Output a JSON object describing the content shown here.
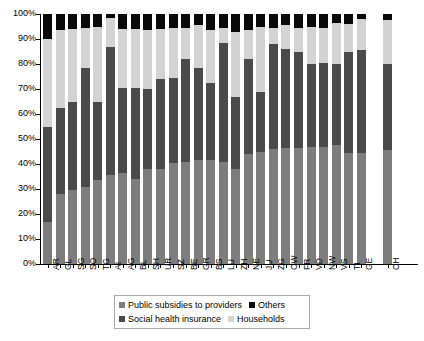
{
  "chart_data": {
    "type": "bar",
    "subtype": "stacked-percentage",
    "title": "",
    "subtitle": "",
    "xlabel": "",
    "ylabel": "",
    "ylim": [
      0,
      100
    ],
    "yticks": [
      "0%",
      "10%",
      "20%",
      "30%",
      "40%",
      "50%",
      "60%",
      "70%",
      "80%",
      "90%",
      "100%"
    ],
    "grid": false,
    "legend_position": "bottom",
    "stack_order_bottom_to_top": [
      "Public subsidies to providers",
      "Social health insurance",
      "Households",
      "Others"
    ],
    "categories": [
      "AR",
      "GL",
      "SG",
      "SO",
      "TG",
      "AI",
      "AG",
      "BL",
      "SH",
      "UR",
      "SZ",
      "BE",
      "GR",
      "BS",
      "LU",
      "ZH",
      "NE",
      "JU",
      "ZG",
      "OW",
      "FR",
      "VD",
      "NW",
      "VS",
      "TI",
      "GE",
      "CH"
    ],
    "series": [
      {
        "name": "Public subsidies to providers",
        "color": "#7d7d7d",
        "values": [
          17,
          28,
          29.5,
          31,
          33.5,
          35.5,
          36.5,
          34,
          38,
          38,
          40.5,
          41,
          41.5,
          41.5,
          41,
          38,
          44,
          45,
          46,
          46.5,
          46.5,
          47,
          47,
          47.5,
          44.5,
          44.5,
          45.5
        ]
      },
      {
        "name": "Social health insurance",
        "color": "#4a4a4a",
        "values": [
          38,
          34.5,
          35.5,
          47.5,
          31.5,
          51.5,
          34,
          36.5,
          32,
          36,
          34,
          41,
          37,
          31,
          47.5,
          29,
          38,
          24,
          42,
          39.5,
          38.5,
          33,
          33.5,
          32.5,
          40.5,
          41,
          34.5
        ]
      },
      {
        "name": "Households",
        "color": "#d3d3d3",
        "values": [
          35,
          31,
          29,
          16,
          30,
          11.5,
          23.5,
          23.5,
          23.5,
          20,
          20,
          12.5,
          17,
          21,
          6,
          26,
          11.5,
          26,
          6.5,
          9.5,
          9.5,
          15,
          14,
          16.5,
          11,
          12.5,
          17.5
        ]
      },
      {
        "name": "Others",
        "color": "#0a0a0a",
        "values": [
          10,
          6.5,
          6,
          5.5,
          5,
          1.5,
          6,
          6,
          6.5,
          6,
          5.5,
          5.5,
          4.5,
          6.5,
          5.5,
          7,
          6.5,
          5,
          5.5,
          4.5,
          5.5,
          5,
          5.5,
          3.5,
          4,
          2,
          2.5
        ]
      }
    ]
  },
  "legend": {
    "items": [
      {
        "label": "Public subsidies to providers",
        "color": "#7d7d7d"
      },
      {
        "label": "Others",
        "color": "#0a0a0a"
      },
      {
        "label": "Social health insurance",
        "color": "#4a4a4a"
      },
      {
        "label": "Households",
        "color": "#d3d3d3"
      }
    ]
  }
}
